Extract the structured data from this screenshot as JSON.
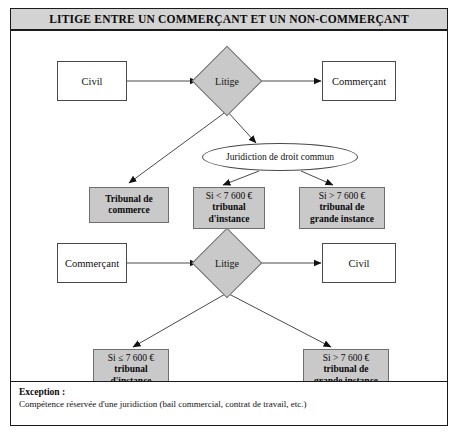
{
  "figure": {
    "title": "LITIGE ENTRE UN COMMERÇANT ET UN NON-COMMERÇANT"
  },
  "flow_top": {
    "source_label": "Civil",
    "decision_label": "Litige",
    "target_label": "Commerçant",
    "jurisdiction_label": "Juridiction de droit commun",
    "outcome_commerce": {
      "line1": "Tribunal de",
      "line2": "commerce"
    },
    "outcome_instance": {
      "line1": "Si < 7 600 €",
      "line2": "tribunal",
      "line3": "d'instance"
    },
    "outcome_grande_instance": {
      "line1": "Si > 7 600 €",
      "line2": "tribunal de",
      "line3": "grande instance"
    }
  },
  "flow_bottom": {
    "source_label": "Commerçant",
    "decision_label": "Litige",
    "target_label": "Civil",
    "outcome_instance": {
      "line1": "Si ≤ 7 600 €",
      "line2": "tribunal",
      "line3": "d'instance"
    },
    "outcome_grande_instance": {
      "line1": "Si > 7 600 €",
      "line2": "tribunal de",
      "line3": "grande instance"
    }
  },
  "exception": {
    "label": "Exception :",
    "text": "Compétence réservée d'une juridiction (bail commercial, contrat de travail, etc.)"
  },
  "colors": {
    "title_band": "#d3d3d3",
    "shaded_node": "#c9c9c9",
    "frame_border": "#1a1a1a",
    "connector": "#4a4a4a"
  }
}
